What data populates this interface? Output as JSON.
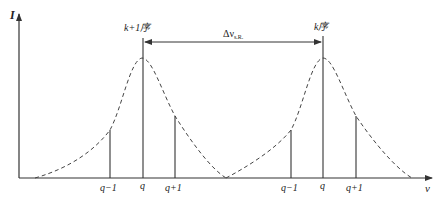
{
  "diagram": {
    "y_axis_label": "I",
    "x_axis_label": "ν",
    "left_order_label": "k+1序",
    "right_order_label": "k序",
    "spacing_label_main": "Δν",
    "spacing_label_sub": "s.R.",
    "left_ticks": [
      "q−1",
      "q",
      "q+1"
    ],
    "right_ticks": [
      "q−1",
      "q",
      "q+1"
    ],
    "colors": {
      "line": "#333333",
      "curve": "#444444",
      "background": "#ffffff"
    }
  }
}
